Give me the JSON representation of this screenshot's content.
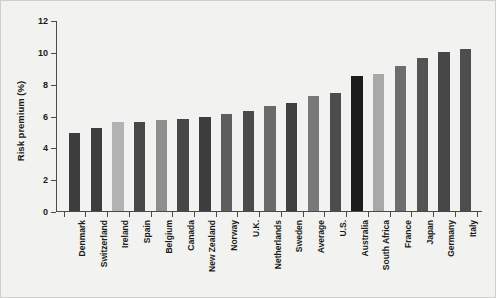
{
  "chart_data": {
    "type": "bar",
    "title": "",
    "xlabel": "",
    "ylabel": "Risk premium (%)",
    "ylim": [
      0,
      12
    ],
    "yticks": [
      0,
      2,
      4,
      6,
      8,
      10,
      12
    ],
    "ytick_labels": [
      "0",
      "2",
      "4",
      "6",
      "8",
      "10",
      "12"
    ],
    "grid": false,
    "legend": "none",
    "categories": [
      "Denmark",
      "Switzerland",
      "Ireland",
      "Spain",
      "Belgium",
      "Canada",
      "New Zealand",
      "Norway",
      "U.K.",
      "Netherlands",
      "Sweden",
      "Average",
      "U.S.",
      "Australia",
      "South Africa",
      "France",
      "Japan",
      "Germany",
      "Italy"
    ],
    "values": [
      4.9,
      5.2,
      5.6,
      5.6,
      5.7,
      5.8,
      5.9,
      6.1,
      6.3,
      6.6,
      6.8,
      7.2,
      7.4,
      8.5,
      8.6,
      9.1,
      9.6,
      10.0,
      10.2
    ],
    "bar_colors": [
      "#3d3d3d",
      "#3d3d3d",
      "#b3b3b3",
      "#484848",
      "#8e8e8e",
      "#474747",
      "#3d3d3d",
      "#5e5e5e",
      "#4a4a4a",
      "#6a6a6a",
      "#3f3f3f",
      "#797979",
      "#4d4d4d",
      "#1c1c1c",
      "#a8a8a8",
      "#6d6d6d",
      "#545454",
      "#474747",
      "#4e4e4e"
    ]
  },
  "figure": {
    "background_color": "#f2f2f0",
    "axis_color": "#4a4a4a",
    "text_color": "#1a1a1a"
  }
}
